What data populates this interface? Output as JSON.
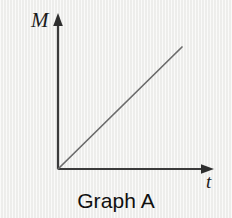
{
  "figure": {
    "caption": "Graph A",
    "background_color": "#f1f1ef",
    "ink_color": "#3a3a3a",
    "text_color": "#101010"
  },
  "axes": {
    "y_axis_label": "M",
    "x_axis_label": "t",
    "origin": {
      "x": 58,
      "y": 169
    },
    "y_axis_top": {
      "x": 58,
      "y": 15
    },
    "x_axis_end": {
      "x": 213,
      "y": 169
    },
    "arrowheads": "both",
    "grid": false,
    "tick_labels": []
  },
  "chart_data": {
    "type": "line",
    "title": "Graph A",
    "xlabel": "t",
    "ylabel": "M",
    "grid": false,
    "legend": null,
    "axis_ticks": {
      "x": [],
      "y": []
    },
    "xlim": [
      0,
      1
    ],
    "ylim": [
      0,
      1
    ],
    "series": [
      {
        "name": "M vs t",
        "description": "straight line of constant positive slope starting at the origin",
        "color": "#6b6b6b",
        "x": [
          0,
          1
        ],
        "y": [
          0,
          1
        ],
        "pixel_start": {
          "x": 58,
          "y": 169
        },
        "pixel_end": {
          "x": 182,
          "y": 47
        }
      }
    ]
  }
}
